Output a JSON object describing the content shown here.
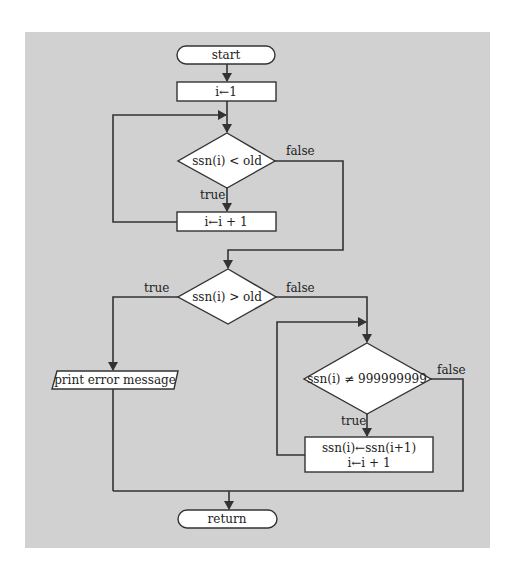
{
  "colors": {
    "background": "#ffffff",
    "panel": "#d1d1d1",
    "line": "#333333",
    "shape_fill": "#ffffff"
  },
  "flowchart": {
    "nodes": {
      "start": {
        "type": "terminal",
        "label": "start"
      },
      "init": {
        "type": "process",
        "label": "i←1"
      },
      "cond1": {
        "type": "decision",
        "label": "ssn(i) < old"
      },
      "incr1": {
        "type": "process",
        "label": "i←i + 1"
      },
      "cond2": {
        "type": "decision",
        "label": "ssn(i) > old"
      },
      "error": {
        "type": "io",
        "label": "print error message"
      },
      "cond3": {
        "type": "decision",
        "label": "ssn(i) ≠ 999999999"
      },
      "shift": {
        "type": "process",
        "line1": "ssn(i)←ssn(i+1)",
        "line2": "i←i + 1"
      },
      "end": {
        "type": "terminal",
        "label": "return"
      }
    },
    "edge_labels": {
      "cond1_false": "false",
      "cond1_true": "true",
      "cond2_true": "true",
      "cond2_false": "false",
      "cond3_false": "false",
      "cond3_true": "true"
    }
  }
}
